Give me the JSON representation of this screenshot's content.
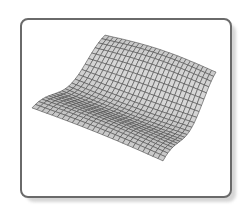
{
  "figure": {
    "icon_name": "surface-plot-icon",
    "colors": {
      "background": "#ffffff",
      "frame_border": "#6a6a6a",
      "frame_shadow": "#d6d6d6",
      "mesh_fill": "#c4c4c4",
      "mesh_line": "#4a4a4a"
    },
    "mesh": {
      "grid_u": 22,
      "grid_v": 26,
      "corners": {
        "left": [
          32,
          113
        ],
        "back": [
          105,
          47
        ],
        "right": [
          216,
          84
        ],
        "front": [
          163,
          166
        ]
      }
    }
  }
}
